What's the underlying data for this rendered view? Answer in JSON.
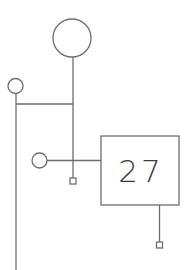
{
  "diagram": {
    "colors": {
      "line": "#6e6e6e",
      "text": "#3a3a3a",
      "background": "#ffffff"
    },
    "node_box": {
      "label": "27",
      "x": 101,
      "y": 136,
      "width": 78,
      "height": 69
    },
    "circles": [
      {
        "name": "top-large-circle",
        "cx": 72,
        "cy": 38,
        "r": 19
      },
      {
        "name": "left-small-circle",
        "cx": 15.5,
        "cy": 86,
        "r": 7.5
      },
      {
        "name": "middle-small-circle",
        "cx": 39.5,
        "cy": 160.5,
        "r": 7.5
      }
    ],
    "terminals": [
      {
        "name": "terminal-square-middle",
        "x": 70,
        "y": 178,
        "size": 6
      },
      {
        "name": "terminal-square-box",
        "x": 156.5,
        "y": 242,
        "size": 6
      }
    ]
  }
}
